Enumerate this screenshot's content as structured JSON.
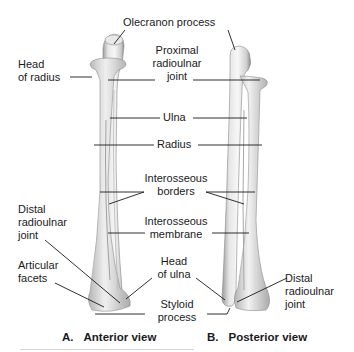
{
  "figure": {
    "views": [
      {
        "letter": "A.",
        "title": "Anterior view"
      },
      {
        "letter": "B.",
        "title": "Posterior view"
      }
    ],
    "labels": {
      "olecranon_process": "Olecranon process",
      "head_of_radius": "Head\nof radius",
      "proximal_radioulnar_joint": "Proximal\nradioulnar\njoint",
      "ulna": "Ulna",
      "radius": "Radius",
      "interosseous_borders": "Interosseous\nborders",
      "interosseous_membrane": "Interosseous\nmembrane",
      "distal_radioulnar_joint_left": "Distal\nradioulnar\njoint",
      "articular_facets": "Articular\nfacets",
      "head_of_ulna": "Head\nof ulna",
      "styloid_process": "Styloid\nprocess",
      "distal_radioulnar_joint_right": "Distal\nradioulnar\njoint"
    },
    "colors": {
      "bone_light": "#f2f2f2",
      "bone_mid": "#d4d4d4",
      "bone_dark": "#8a8a8a",
      "leader_line": "#1a1a1a",
      "text": "#1a1a1a"
    }
  }
}
